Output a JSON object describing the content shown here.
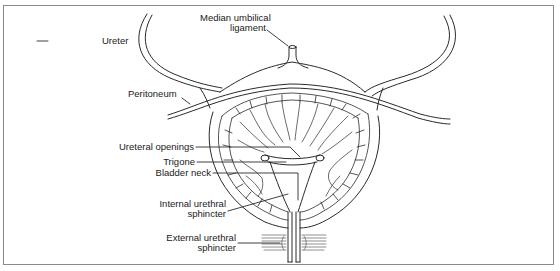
{
  "figure": {
    "labels": {
      "median_umbilical_ligament": [
        "Median umbilical",
        "ligament"
      ],
      "ureter": "Ureter",
      "peritoneum": "Peritoneum",
      "ureteral_openings": "Ureteral openings",
      "trigone": "Trigone",
      "bladder_neck": "Bladder neck",
      "internal_urethral_sphincter": [
        "Internal urethral",
        "sphincter"
      ],
      "external_urethral_sphincter": [
        "External urethral",
        "sphincter"
      ]
    },
    "colors": {
      "line": "#2a2a2a",
      "frame": "#8a8a8a",
      "background": "#ffffff"
    }
  }
}
